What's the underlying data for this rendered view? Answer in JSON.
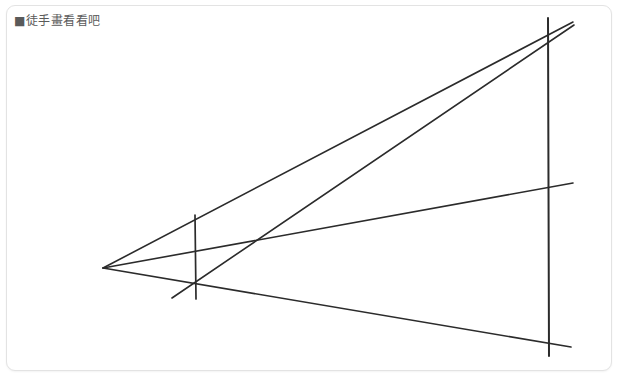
{
  "window": {
    "width": 621,
    "height": 384,
    "background_color": "#ffffff"
  },
  "frame": {
    "border_color": "#e3e3e3",
    "corner_radius": 9
  },
  "caption": {
    "text": "■徒手畫看看吧",
    "bullet_glyph": "■",
    "color": "#5a5a5a"
  },
  "drawing": {
    "title": "one-point perspective freehand sketch",
    "stroke_color": "#2b2b2b",
    "stroke_width": 1.6,
    "vanishing_point": {
      "x": 103,
      "y": 268
    },
    "lines": [
      {
        "name": "perspective-ray-upper",
        "x1": 103,
        "y1": 268,
        "x2": 573,
        "y2": 22,
        "width": 1.6
      },
      {
        "name": "perspective-ray-middle",
        "x1": 103,
        "y1": 268,
        "x2": 573,
        "y2": 183,
        "width": 1.6
      },
      {
        "name": "perspective-ray-lower",
        "x1": 103,
        "y1": 268,
        "x2": 571,
        "y2": 347,
        "width": 1.6
      },
      {
        "name": "diagonal-edge-line",
        "x1": 172,
        "y1": 298,
        "x2": 574,
        "y2": 25,
        "width": 1.6
      },
      {
        "name": "vertical-near-edge",
        "x1": 195,
        "y1": 215,
        "x2": 196,
        "y2": 299,
        "width": 1.7
      },
      {
        "name": "vertical-far-edge",
        "x1": 548,
        "y1": 18,
        "x2": 549,
        "y2": 356,
        "width": 2.0
      }
    ]
  }
}
